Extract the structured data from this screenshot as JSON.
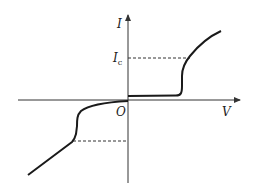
{
  "diagram": {
    "type": "I-V characteristic curve",
    "axes": {
      "x_label": "V",
      "y_label": "I",
      "origin_label": "O"
    },
    "annotations": {
      "critical_current_label": "I",
      "critical_current_subscript": "c"
    },
    "colors": {
      "line": "#1a1a1a",
      "axis": "#333333",
      "background": "#ffffff"
    }
  }
}
